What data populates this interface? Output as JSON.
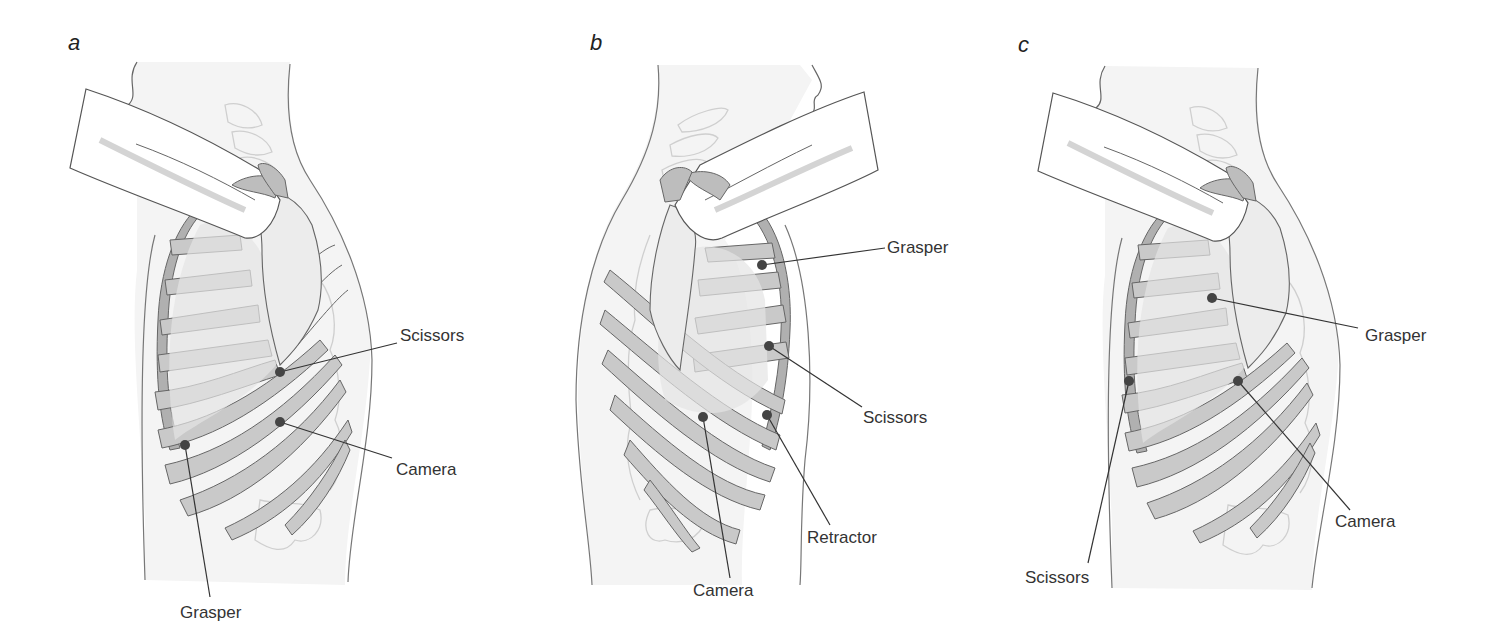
{
  "figure": {
    "panels": [
      {
        "letter": "a",
        "view": "left-lateral",
        "ports": [
          {
            "label": "Scissors",
            "dot": [
              280,
              372
            ],
            "label_pos": [
              370,
              300
            ]
          },
          {
            "label": "Camera",
            "dot": [
              280,
              422
            ],
            "label_pos": [
              395,
              460
            ]
          },
          {
            "label": "Grasper",
            "dot": [
              185,
              445
            ],
            "label_pos": [
              180,
              600
            ]
          }
        ]
      },
      {
        "letter": "b",
        "view": "right-lateral",
        "ports": [
          {
            "label": "Grasper",
            "dot": [
              762,
              265
            ],
            "label_pos": [
              887,
              237
            ]
          },
          {
            "label": "Scissors",
            "dot": [
              769,
              346
            ],
            "label_pos": [
              863,
              410
            ]
          },
          {
            "label": "Retractor",
            "dot": [
              767,
              415
            ],
            "label_pos": [
              807,
              530
            ]
          },
          {
            "label": "Camera",
            "dot": [
              703,
              417
            ],
            "label_pos": [
              693,
              582
            ]
          }
        ]
      },
      {
        "letter": "c",
        "view": "left-lateral",
        "ports": [
          {
            "label": "Grasper",
            "dot": [
              1212,
              298
            ],
            "label_pos": [
              1365,
              326
            ]
          },
          {
            "label": "Camera",
            "dot": [
              1238,
              381
            ],
            "label_pos": [
              1335,
              513
            ]
          },
          {
            "label": "Scissors",
            "dot": [
              1129,
              381
            ],
            "label_pos": [
              1025,
              570
            ]
          }
        ]
      }
    ],
    "colors": {
      "outline": "#555555",
      "rib_fill": "#c9c9c9",
      "rib_dark": "#a9a9a9",
      "lung_fill": "#e4e4e4",
      "body_fill": "#f4f4f4",
      "spine_stroke": "#c8c8c8",
      "port_dot": "#444444",
      "label": "#333333"
    }
  }
}
